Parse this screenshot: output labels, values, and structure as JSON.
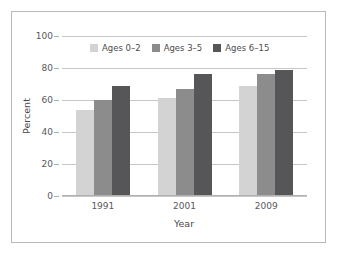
{
  "chart_data": {
    "type": "bar",
    "title": "",
    "xlabel": "Year",
    "ylabel": "Percent",
    "categories": [
      "1991",
      "2001",
      "2009"
    ],
    "series": [
      {
        "name": "Ages 0–2",
        "values": [
          54,
          61,
          69
        ],
        "color": "#d3d3d3"
      },
      {
        "name": "Ages 3–5",
        "values": [
          60,
          67,
          76
        ],
        "color": "#8c8c8c"
      },
      {
        "name": "Ages 6–15",
        "values": [
          69,
          76,
          79
        ],
        "color": "#565658"
      }
    ],
    "ylim": [
      0,
      100
    ],
    "yticks": [
      0,
      20,
      40,
      60,
      80,
      100
    ],
    "ytick_labels": [
      "0",
      "20",
      "40",
      "60",
      "80",
      "100"
    ],
    "grid": "horizontal",
    "legend_position": "upper center inside"
  },
  "colors": {
    "frame": "#b9b9b9",
    "gridline": "#c6c6c6",
    "axis": "#b0b0b0",
    "tick_text": "#59595b",
    "axis_label_text": "#4a4a4c",
    "background": "#ffffff"
  }
}
